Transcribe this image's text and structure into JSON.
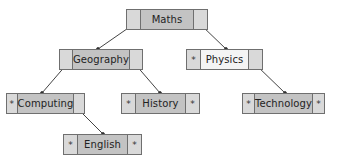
{
  "diagram": {
    "type": "tree",
    "colors": {
      "node_border": "#6f6f6f",
      "side_cell": "#d9d9d9",
      "label_cell": "#c3c3c3",
      "label_cell_light": "#f4f4f4",
      "edge": "#444444"
    },
    "nodes": [
      {
        "id": "maths",
        "label": "Maths",
        "left": "",
        "right": "",
        "x": 126,
        "y": 9,
        "w": 82
      },
      {
        "id": "geography",
        "label": "Geography",
        "left": "",
        "right": "",
        "x": 59,
        "y": 49,
        "w": 84
      },
      {
        "id": "physics",
        "label": "Physics",
        "left": "*",
        "right": "",
        "x": 186,
        "y": 49,
        "w": 77
      },
      {
        "id": "computing",
        "label": "Computing",
        "left": "*",
        "right": "",
        "x": 6,
        "y": 93,
        "w": 79
      },
      {
        "id": "history",
        "label": "History",
        "left": "*",
        "right": "*",
        "x": 121,
        "y": 93,
        "w": 79
      },
      {
        "id": "technology",
        "label": "Technology",
        "left": "*",
        "right": "*",
        "x": 242,
        "y": 93,
        "w": 83
      },
      {
        "id": "english",
        "label": "English",
        "left": "*",
        "right": "*",
        "x": 63,
        "y": 134,
        "w": 79
      }
    ],
    "edges": [
      {
        "from": "maths",
        "to": "geography"
      },
      {
        "from": "maths",
        "to": "physics"
      },
      {
        "from": "geography",
        "to": "computing"
      },
      {
        "from": "geography",
        "to": "history"
      },
      {
        "from": "physics",
        "to": "technology"
      },
      {
        "from": "computing",
        "to": "english"
      }
    ]
  }
}
